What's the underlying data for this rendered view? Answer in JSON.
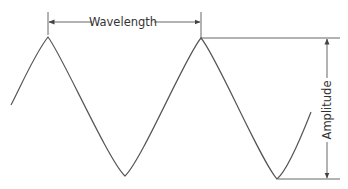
{
  "diagram": {
    "labels": {
      "wavelength": "Wavelength",
      "amplitude": "Amplitude"
    },
    "colors": {
      "stroke": "#555555",
      "text": "#333333",
      "background": "#ffffff"
    },
    "wave": {
      "start": [
        11,
        105
      ],
      "peaks": [
        [
          48,
          37
        ],
        [
          201,
          38
        ]
      ],
      "troughs": [
        [
          125,
          176
        ],
        [
          277,
          179
        ]
      ],
      "end": [
        311,
        112
      ]
    }
  }
}
